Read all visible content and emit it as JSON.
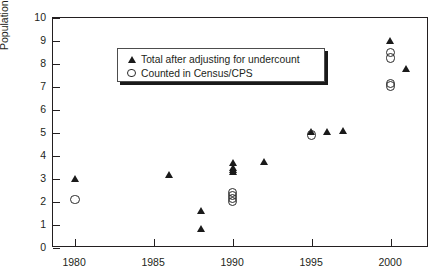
{
  "chart_data": {
    "type": "scatter",
    "title": "",
    "xlabel": "",
    "ylabel": "Population (millions)",
    "xlim": [
      1978.6,
      2002.4
    ],
    "ylim": [
      0,
      10
    ],
    "xticks": [
      1980,
      1985,
      1990,
      1995,
      2000
    ],
    "yticks": [
      0,
      1,
      2,
      3,
      4,
      5,
      6,
      7,
      8,
      9,
      10
    ],
    "grid": false,
    "legend_position": "upper-left",
    "series": [
      {
        "name": "Total after adjusting for undercount",
        "marker": "filled-triangle",
        "color": "#1a1a1a",
        "points": [
          {
            "x": 1980,
            "y": 3.0
          },
          {
            "x": 1986,
            "y": 3.2
          },
          {
            "x": 1988,
            "y": 1.6
          },
          {
            "x": 1988,
            "y": 0.85
          },
          {
            "x": 1990,
            "y": 3.7
          },
          {
            "x": 1990,
            "y": 3.5
          },
          {
            "x": 1990,
            "y": 3.4
          },
          {
            "x": 1990,
            "y": 3.3
          },
          {
            "x": 1992,
            "y": 3.75
          },
          {
            "x": 1995,
            "y": 5.05
          },
          {
            "x": 1996,
            "y": 5.05
          },
          {
            "x": 1997,
            "y": 5.1
          },
          {
            "x": 2000,
            "y": 9.0
          },
          {
            "x": 2001,
            "y": 7.8
          }
        ]
      },
      {
        "name": "Counted in Census/CPS",
        "marker": "open-circle",
        "color": "#2a2a2a",
        "points": [
          {
            "x": 1980,
            "y": 2.1
          },
          {
            "x": 1990,
            "y": 2.4
          },
          {
            "x": 1990,
            "y": 2.28
          },
          {
            "x": 1990,
            "y": 2.15
          },
          {
            "x": 1990,
            "y": 2.02
          },
          {
            "x": 1995,
            "y": 4.9
          },
          {
            "x": 2000,
            "y": 8.5
          },
          {
            "x": 2000,
            "y": 8.25
          },
          {
            "x": 2000,
            "y": 7.15
          },
          {
            "x": 2000,
            "y": 7.03
          }
        ]
      }
    ]
  },
  "legend": {
    "entries": [
      {
        "symbol": "filled-triangle",
        "label": "Total after adjusting for undercount"
      },
      {
        "symbol": "open-circle",
        "label": "Counted in Census/CPS"
      }
    ]
  }
}
